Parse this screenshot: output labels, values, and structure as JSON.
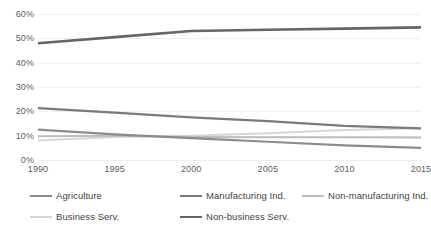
{
  "chart_data": {
    "type": "line",
    "title": "",
    "subtitle": "",
    "xlabel": "",
    "ylabel": "",
    "x": [
      1990,
      1995,
      2000,
      2005,
      2010,
      2015
    ],
    "categories": [
      "1990",
      "1995",
      "2000",
      "2005",
      "2010",
      "2015"
    ],
    "xtick_labels": [
      "1990",
      "1995",
      "2000",
      "2005",
      "2010",
      "2015"
    ],
    "ytick_labels": [
      "0%",
      "10%",
      "20%",
      "30%",
      "40%",
      "50%",
      "60%"
    ],
    "ytick_values": [
      0,
      10,
      20,
      30,
      40,
      50,
      60
    ],
    "ylim": [
      0,
      60
    ],
    "xlim": [
      1990,
      2015
    ],
    "grid": "horizontal",
    "legend_position": "bottom",
    "value_format": "percent",
    "series": [
      {
        "name": "Agriculture",
        "values": [
          12.5,
          10.5,
          9.0,
          7.5,
          6.0,
          5.0
        ],
        "color": "#8c8c8c",
        "width": 2.2
      },
      {
        "name": "Manufacturing Ind.",
        "values": [
          21.3,
          19.5,
          17.5,
          16.0,
          14.0,
          13.0
        ],
        "color": "#7a7a7a",
        "width": 2.2
      },
      {
        "name": "Non-manufacturing Ind.",
        "values": [
          9.8,
          10.0,
          9.5,
          9.3,
          9.3,
          9.2
        ],
        "color": "#bdbdbd",
        "width": 2.0
      },
      {
        "name": "Business Serv.",
        "values": [
          8.0,
          9.5,
          10.0,
          11.0,
          12.3,
          13.0
        ],
        "color": "#d6d6d6",
        "width": 2.0
      },
      {
        "name": "Non-business Serv.",
        "values": [
          48.0,
          50.5,
          53.0,
          53.5,
          54.0,
          54.5
        ],
        "color": "#666666",
        "width": 2.6
      }
    ]
  },
  "legend": {
    "items": [
      {
        "label": "Agriculture",
        "color": "#8c8c8c",
        "width": 2.2
      },
      {
        "label": "Manufacturing Ind.",
        "color": "#7a7a7a",
        "width": 2.2
      },
      {
        "label": "Non-manufacturing Ind.",
        "color": "#bdbdbd",
        "width": 2.0
      },
      {
        "label": "Business Serv.",
        "color": "#d6d6d6",
        "width": 2.0
      },
      {
        "label": "Non-business Serv.",
        "color": "#666666",
        "width": 2.6
      }
    ]
  },
  "colors": {
    "background": "#ffffff",
    "gridline": "#f0f0f0",
    "axis_text": "#5e5e5e",
    "legend_text": "#444444"
  }
}
